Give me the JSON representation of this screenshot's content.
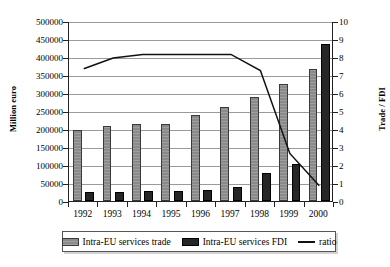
{
  "chart_data": {
    "type": "bar",
    "title": "",
    "xlabel": "",
    "ylabel": "Million euro",
    "y2label": "Trade / FDI",
    "categories": [
      "1992",
      "1993",
      "1994",
      "1995",
      "1996",
      "1997",
      "1998",
      "2000-placeholder",
      "2000"
    ],
    "x": [
      "1992",
      "1993",
      "1994",
      "1995",
      "1996",
      "1997",
      "1998",
      "1999",
      "2000"
    ],
    "ylim": [
      0,
      500000
    ],
    "y2lim": [
      0,
      10
    ],
    "yticks": [
      0,
      50000,
      100000,
      150000,
      200000,
      250000,
      300000,
      350000,
      400000,
      450000,
      500000
    ],
    "y2ticks": [
      0,
      1,
      2,
      3,
      4,
      5,
      6,
      7,
      8,
      9,
      10
    ],
    "grid": true,
    "legend_position": "bottom",
    "series": [
      {
        "name": "Intra-EU services trade",
        "kind": "bar",
        "axis": "left",
        "color": "#8a8a8a",
        "values": [
          196000,
          208000,
          214000,
          213000,
          238000,
          262000,
          288000,
          324000,
          367000
        ]
      },
      {
        "name": "Intra-EU services FDI",
        "kind": "bar",
        "axis": "left",
        "color": "#262626",
        "values": [
          25000,
          26000,
          28000,
          28000,
          30000,
          39000,
          79000,
          103000,
          437000
        ]
      },
      {
        "name": "ratio",
        "kind": "line",
        "axis": "right",
        "color": "#111111",
        "values": [
          7.4,
          8.0,
          8.2,
          8.2,
          8.2,
          8.2,
          7.3,
          2.7,
          0.9
        ]
      }
    ]
  },
  "legend": {
    "items": [
      {
        "label": "Intra-EU services trade",
        "marker": "square-gray"
      },
      {
        "label": "Intra-EU services FDI",
        "marker": "square-black"
      },
      {
        "label": "ratio",
        "marker": "line-black"
      }
    ]
  },
  "axes": {
    "left_title": "Million euro",
    "right_title": "Trade / FDI"
  }
}
